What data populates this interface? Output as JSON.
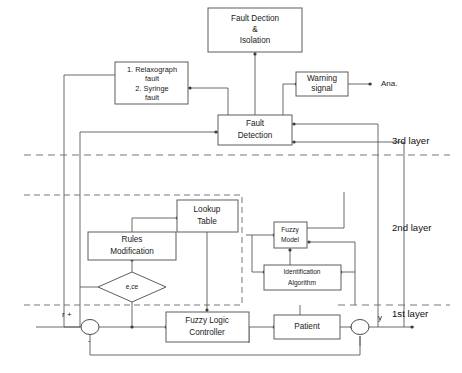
{
  "diagram": {
    "blocks": {
      "fault_detection_isolation": {
        "line1": "Fault Dection",
        "line2": "&",
        "line3": "Isolation"
      },
      "fault_list": {
        "line1": "1. Relaxograph",
        "line2": "fault",
        "line3": "2. Syringe",
        "line4": "fault"
      },
      "warning_signal": {
        "line1": "Warning",
        "line2": "signal"
      },
      "fault_detection": {
        "line1": "Fault",
        "line2": "Detection"
      },
      "lookup_table": {
        "line1": "Lookup",
        "line2": "Table"
      },
      "rules_modification": {
        "line1": "Rules",
        "line2": "Modification"
      },
      "fuzzy_model": {
        "line1": "Fuzzy",
        "line2": "Model"
      },
      "identification_algorithm": {
        "line1": "Identification",
        "line2": "Algorithm"
      },
      "fuzzy_logic_controller": {
        "line1": "Fuzzy Logic",
        "line2": "Controller"
      },
      "patient": {
        "line1": "Patient"
      },
      "error_decision": {
        "label": "e,ce"
      }
    },
    "layers": {
      "third": "3rd layer",
      "second": "2nd layer",
      "first": "1st layer"
    },
    "signals": {
      "reference": "r +",
      "negative_feedback": "-",
      "output": "y",
      "analysis": "Ana."
    },
    "colors": {
      "background": "#ffffff",
      "line": "#5a5a5a",
      "box_stroke": "#5d5d5d",
      "text": "#1a1a1a"
    }
  }
}
